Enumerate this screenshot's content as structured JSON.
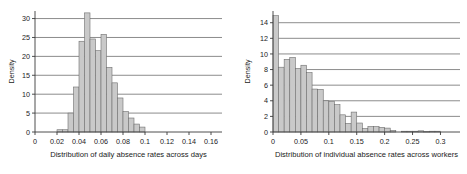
{
  "figure": {
    "background": "#ffffff",
    "bar_fill": "#c9c9c9",
    "bar_stroke": "#6e6e6e",
    "grid_color": "#5a5a5a",
    "axis_color": "#3a3a3a",
    "text_color": "#1a1a1a"
  },
  "chart_data": [
    {
      "type": "bar",
      "id": "daily-absence-histogram",
      "title": "",
      "xlabel": "Distribution of daily absence rates across days",
      "ylabel": "Density",
      "xlim": [
        0,
        0.17
      ],
      "ylim": [
        0,
        32
      ],
      "grid": true,
      "grid_axis": "y",
      "legend": "none",
      "bin_width": 0.005,
      "xticks": [
        0,
        0.02,
        0.04,
        0.06,
        0.08,
        0.1,
        0.12,
        0.14,
        0.16
      ],
      "xtick_labels": [
        "0",
        "0.02",
        "0.04",
        "0.06",
        "0.08",
        "0.1",
        "0.12",
        "0.14",
        "0.16"
      ],
      "yticks": [
        0,
        5,
        10,
        15,
        20,
        25,
        30
      ],
      "ytick_labels": [
        "0",
        "5",
        "10",
        "15",
        "20",
        "25",
        "30"
      ],
      "bin_edges": [
        0.02,
        0.025,
        0.03,
        0.035,
        0.04,
        0.045,
        0.05,
        0.055,
        0.06,
        0.065,
        0.07,
        0.075,
        0.08,
        0.085,
        0.09,
        0.095,
        0.1
      ],
      "x": [
        0.0225,
        0.0275,
        0.0325,
        0.0375,
        0.0425,
        0.0475,
        0.0525,
        0.0575,
        0.0625,
        0.0675,
        0.0725,
        0.0775,
        0.0825,
        0.0875,
        0.0925,
        0.0975
      ],
      "values": [
        0.6,
        0.6,
        5.0,
        11.9,
        24.0,
        31.5,
        24.6,
        21.5,
        25.8,
        17.1,
        13.0,
        9.0,
        5.4,
        3.7,
        2.1,
        1.3
      ],
      "categories": [
        "0.0225",
        "0.0275",
        "0.0325",
        "0.0375",
        "0.0425",
        "0.0475",
        "0.0525",
        "0.0575",
        "0.0625",
        "0.0675",
        "0.0725",
        "0.0775",
        "0.0825",
        "0.0875",
        "0.0925",
        "0.0975"
      ]
    },
    {
      "type": "bar",
      "id": "individual-absence-histogram",
      "title": "",
      "xlabel": "Distribution of individual absence rates across workers",
      "ylabel": "Density",
      "xlim": [
        0,
        0.335
      ],
      "ylim": [
        0,
        15.5
      ],
      "grid": true,
      "grid_axis": "y",
      "legend": "none",
      "bin_width": 0.01,
      "xticks": [
        0,
        0.05,
        0.1,
        0.15,
        0.2,
        0.25,
        0.3
      ],
      "xtick_labels": [
        "0",
        "0.05",
        "0.1",
        "0.15",
        "0.2",
        "0.25",
        "0.3"
      ],
      "yticks": [
        0,
        2,
        4,
        6,
        8,
        10,
        12,
        14
      ],
      "ytick_labels": [
        "0",
        "2",
        "4",
        "6",
        "8",
        "10",
        "12",
        "14"
      ],
      "bin_edges": [
        0.0,
        0.01,
        0.02,
        0.03,
        0.04,
        0.05,
        0.06,
        0.07,
        0.08,
        0.09,
        0.1,
        0.11,
        0.12,
        0.13,
        0.14,
        0.15,
        0.16,
        0.17,
        0.18,
        0.19,
        0.2,
        0.21,
        0.22,
        0.23,
        0.24,
        0.25,
        0.26,
        0.27,
        0.28,
        0.29,
        0.3,
        0.31,
        0.32,
        0.33
      ],
      "x": [
        0.005,
        0.015,
        0.025,
        0.035,
        0.045,
        0.055,
        0.065,
        0.075,
        0.085,
        0.095,
        0.105,
        0.115,
        0.125,
        0.135,
        0.145,
        0.155,
        0.165,
        0.175,
        0.185,
        0.195,
        0.205,
        0.215,
        0.225,
        0.235,
        0.245,
        0.255,
        0.265,
        0.275,
        0.285,
        0.295,
        0.305,
        0.315,
        0.325
      ],
      "values": [
        14.9,
        8.3,
        9.3,
        9.55,
        8.15,
        8.55,
        7.6,
        5.5,
        5.45,
        4.0,
        3.9,
        3.5,
        2.2,
        1.1,
        2.55,
        1.15,
        0.45,
        0.7,
        0.7,
        0.6,
        0.5,
        0.2,
        0.0,
        0.1,
        0.1,
        0.1,
        0.15,
        0.05,
        0.1,
        0.1,
        0.0,
        0.0,
        0.0
      ],
      "categories": [
        "0.005",
        "0.015",
        "0.025",
        "0.035",
        "0.045",
        "0.055",
        "0.065",
        "0.075",
        "0.085",
        "0.095",
        "0.105",
        "0.115",
        "0.125",
        "0.135",
        "0.145",
        "0.155",
        "0.165",
        "0.175",
        "0.185",
        "0.195",
        "0.205",
        "0.215",
        "0.225",
        "0.235",
        "0.245",
        "0.255",
        "0.265",
        "0.275",
        "0.285",
        "0.295",
        "0.305",
        "0.315",
        "0.325"
      ]
    }
  ]
}
